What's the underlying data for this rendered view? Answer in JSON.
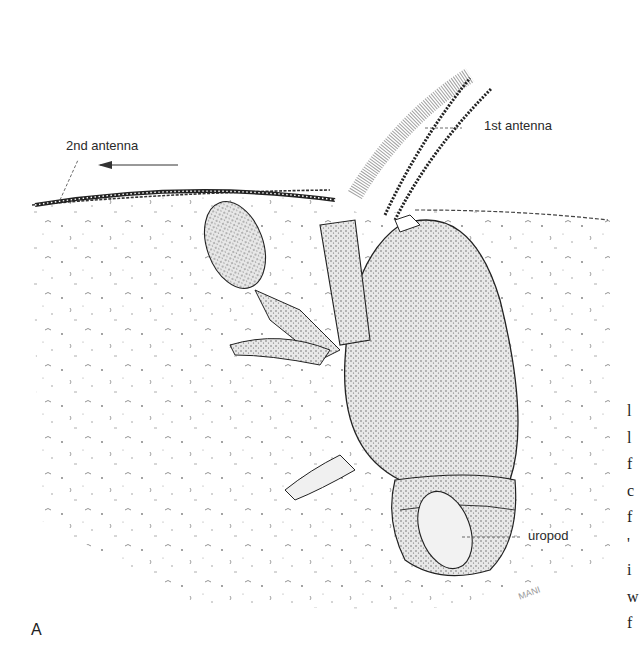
{
  "figure": {
    "panel_letter": "A",
    "artist_signature": "MANI"
  },
  "labels": {
    "second_antenna": "2nd antenna",
    "first_antenna": "1st antenna",
    "uropod": "uropod"
  },
  "cropped_side_text": [
    "l",
    "l",
    "f",
    "c",
    "f",
    "'",
    "i",
    "w",
    "f"
  ],
  "colors": {
    "ink": "#2a2a2a",
    "background": "#ffffff",
    "stipple": "#555555"
  }
}
